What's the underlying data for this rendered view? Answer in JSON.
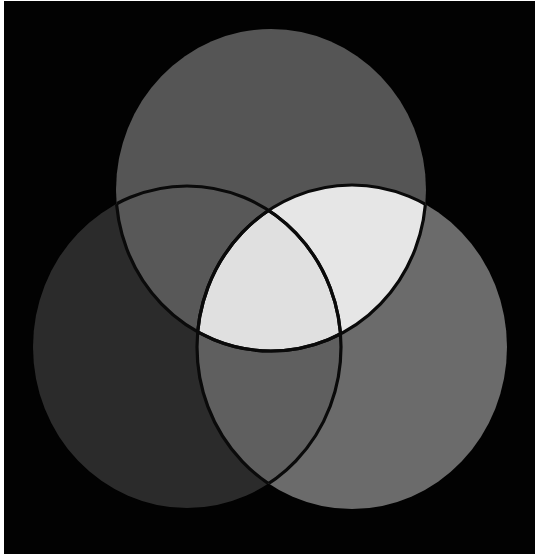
{
  "diagram": {
    "type": "three-set venn (additive light mixing, grayscale print)",
    "background": "#020202",
    "border_color": "#ffffff",
    "outline_color": "#0a0a0a",
    "circles": [
      {
        "id": "top",
        "cx": 271,
        "cy": 190,
        "rx": 155,
        "ry": 161
      },
      {
        "id": "left",
        "cx": 187,
        "cy": 347,
        "rx": 154,
        "ry": 161
      },
      {
        "id": "right",
        "cx": 352,
        "cy": 347,
        "rx": 155,
        "ry": 162
      }
    ],
    "regions": {
      "top_only": "#555555",
      "left_only": "#2b2b2b",
      "right_only": "#6b6b6b",
      "top_left": "#585858",
      "top_right": "#e6e6e6",
      "left_right": "#5f5f5f",
      "center": "#e0e0e0"
    },
    "labels": []
  }
}
